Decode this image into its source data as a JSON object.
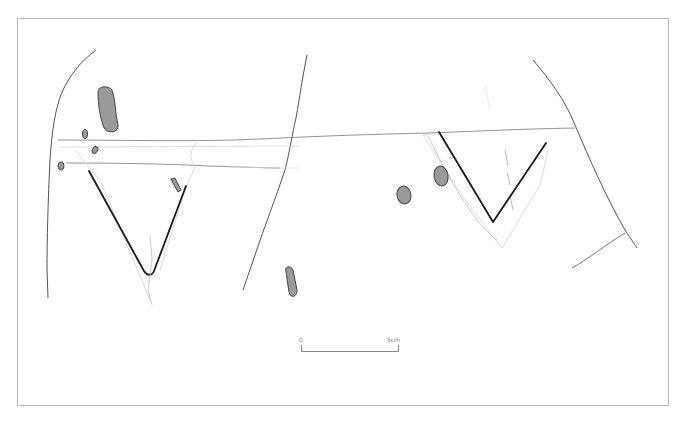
{
  "figure": {
    "type": "archaeological line drawing"
  },
  "scale_bar": {
    "start_label": "0",
    "end_label": "5cm"
  },
  "colors": {
    "background": "#ffffff",
    "frame": "#bdbdbd",
    "heavy_line": "#1a1a1a",
    "crack_line": "#555555",
    "faint_line": "#cfcfcf",
    "inclusion_fill": "#9a9a9a"
  }
}
